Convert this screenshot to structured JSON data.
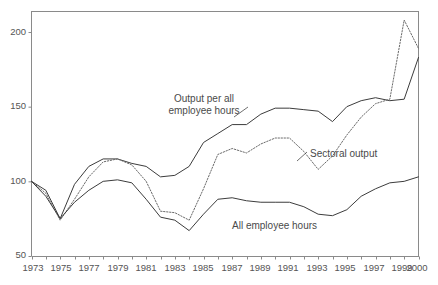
{
  "chart_data": {
    "type": "line",
    "title": "",
    "subtitle": "",
    "xlabel": "",
    "ylabel": "",
    "xlim": [
      1973,
      2000
    ],
    "ylim": [
      50,
      212
    ],
    "grid": false,
    "legend_position": "inline-annotations",
    "y_ticks": [
      50,
      100,
      150,
      200
    ],
    "x_ticks": [
      1973,
      1975,
      1977,
      1979,
      1981,
      1983,
      1985,
      1987,
      1989,
      1991,
      1993,
      1995,
      1997,
      1999,
      2000
    ],
    "x_tick_labels": [
      "1973",
      "1975",
      "1977",
      "1979",
      "1981",
      "1983",
      "1985",
      "1987",
      "1989",
      "1991",
      "1993",
      "1995",
      "1997",
      "1999",
      "2000"
    ],
    "y_tick_labels": [
      "50",
      "100",
      "150",
      "200"
    ],
    "x": [
      1973,
      1974,
      1975,
      1976,
      1977,
      1978,
      1979,
      1980,
      1981,
      1982,
      1983,
      1984,
      1985,
      1986,
      1987,
      1988,
      1989,
      1990,
      1991,
      1992,
      1993,
      1994,
      1995,
      1996,
      1997,
      1998,
      1999,
      2000
    ],
    "series": [
      {
        "name": "Output per all employee hours",
        "style": "solid",
        "color": "#3c3c3c",
        "values": [
          100,
          94,
          75,
          98,
          110,
          115,
          115,
          112,
          110,
          103,
          104,
          110,
          126,
          132,
          138,
          138,
          145,
          149,
          149,
          148,
          147,
          140,
          150,
          154,
          156,
          154,
          155,
          183
        ]
      },
      {
        "name": "Sectoral output",
        "style": "dotted",
        "color": "#6a6a6a",
        "values": [
          100,
          92,
          74,
          88,
          103,
          113,
          115,
          111,
          100,
          80,
          79,
          74,
          95,
          118,
          122,
          119,
          125,
          129,
          129,
          120,
          108,
          117,
          131,
          143,
          152,
          155,
          208,
          189
        ]
      },
      {
        "name": "All employee hours",
        "style": "solid",
        "color": "#3c3c3c",
        "values": [
          100,
          90,
          75,
          86,
          94,
          100,
          101,
          99,
          88,
          76,
          74,
          67,
          78,
          88,
          89,
          87,
          86,
          86,
          86,
          83,
          78,
          77,
          81,
          90,
          95,
          99,
          100,
          103
        ]
      }
    ],
    "annotations": [
      {
        "id": "output-per-hours",
        "text_line1": "Output per all",
        "text_line2": "employee hours"
      },
      {
        "id": "sectoral-output",
        "text_line1": "Sectoral output",
        "text_line2": ""
      },
      {
        "id": "all-employee-hours",
        "text_line1": "All employee hours",
        "text_line2": ""
      }
    ]
  },
  "axes": {
    "y_labels": [
      "200",
      "150",
      "100",
      "50"
    ],
    "x_labels": [
      "1973",
      "1975",
      "1977",
      "1979",
      "1981",
      "1983",
      "1985",
      "1987",
      "1989",
      "1991",
      "1993",
      "1995",
      "1997",
      "1999",
      "2000"
    ]
  },
  "labels": {
    "output_line1": "Output per all",
    "output_line2": "employee hours",
    "sectoral": "Sectoral output",
    "hours": "All employee hours"
  },
  "colors": {
    "axis": "#8a8a8a",
    "solid_series": "#3c3c3c",
    "dotted_series": "#6a6a6a",
    "text": "#555555",
    "background": "#ffffff"
  }
}
